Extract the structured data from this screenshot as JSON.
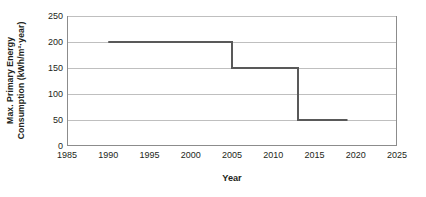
{
  "chart_data": {
    "type": "line",
    "title": "",
    "xlabel": "Year",
    "ylabel_line1": "Max. Primary Energy",
    "ylabel_line2": "Consumption (kWh/m²·year)",
    "ylabel": "Max. Primary Energy Consumption (kWh/m²·year)",
    "xlim": [
      1985,
      2025
    ],
    "ylim": [
      0,
      250
    ],
    "xticks": [
      1985,
      1990,
      1995,
      2000,
      2005,
      2010,
      2015,
      2020,
      2025
    ],
    "yticks": [
      0,
      50,
      100,
      150,
      200,
      250
    ],
    "grid": "horizontal",
    "legend": "none",
    "line_color": "#595959",
    "line_width": 2,
    "step_style": "post",
    "series": [
      {
        "name": "Max. Primary Energy Consumption",
        "x": [
          1990,
          2005,
          2013,
          2019
        ],
        "values": [
          200,
          150,
          50,
          50
        ],
        "points": [
          {
            "x": 1990,
            "y": 200
          },
          {
            "x": 2005,
            "y": 200
          },
          {
            "x": 2005,
            "y": 150
          },
          {
            "x": 2013,
            "y": 150
          },
          {
            "x": 2013,
            "y": 50
          },
          {
            "x": 2019,
            "y": 50
          }
        ]
      }
    ]
  },
  "axes": {
    "frame_color": "#8c8c8c",
    "grid_color": "#bfbfbf",
    "tick_font_size": 9
  }
}
